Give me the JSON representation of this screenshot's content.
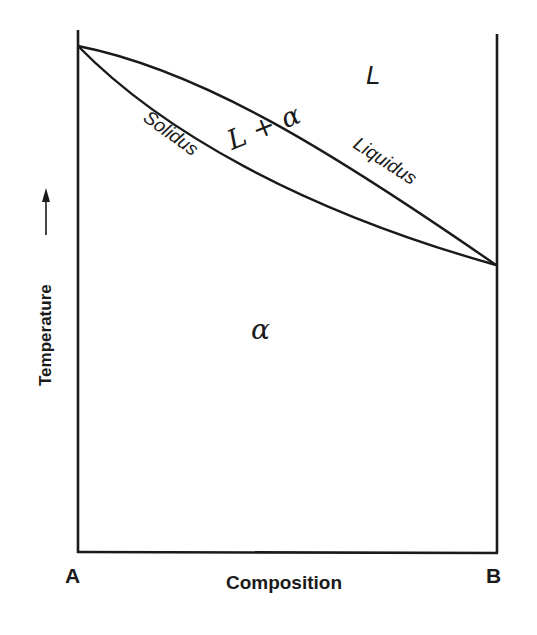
{
  "diagram": {
    "type": "binary-isomorphous-phase-diagram",
    "axes": {
      "x_label": "Composition",
      "y_label": "Temperature",
      "y_arrow": "→",
      "left_endpoint_label": "A",
      "right_endpoint_label": "B"
    },
    "regions": {
      "liquid": "L",
      "two_phase": "L + α",
      "solid": "α"
    },
    "curves": {
      "upper": "Liquidus",
      "lower": "Solidus"
    },
    "colors": {
      "line": "#1a1a1a",
      "background": "#ffffff"
    }
  }
}
